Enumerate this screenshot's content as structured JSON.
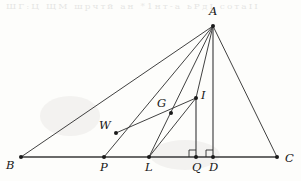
{
  "figure": {
    "width": 301,
    "height": 181,
    "background_color": "#fdfdfb",
    "line_color": "#2b2b2b",
    "base_line_color": "#3a3a3a",
    "vertical_line_color": "#555555",
    "label_color": "#161616"
  },
  "points": {
    "A": {
      "label": "A",
      "x": 213,
      "y": 26,
      "label_x": 209,
      "label_y": 6
    },
    "B": {
      "label": "B",
      "x": 21,
      "y": 157,
      "label_x": 6,
      "label_y": 160
    },
    "C": {
      "label": "C",
      "x": 277,
      "y": 157,
      "label_x": 285,
      "label_y": 153
    },
    "P": {
      "label": "P",
      "x": 104,
      "y": 157,
      "label_x": 100,
      "label_y": 162
    },
    "L": {
      "label": "L",
      "x": 149,
      "y": 157,
      "label_x": 145,
      "label_y": 162
    },
    "Q": {
      "label": "Q",
      "x": 196,
      "y": 157,
      "label_x": 192,
      "label_y": 162
    },
    "D": {
      "label": "D",
      "x": 213,
      "y": 157,
      "label_x": 209,
      "label_y": 162
    },
    "W": {
      "label": "W",
      "x": 116,
      "y": 133,
      "label_x": 99,
      "label_y": 120
    },
    "G": {
      "label": "G",
      "x": 171,
      "y": 113,
      "label_x": 157,
      "label_y": 98
    },
    "I": {
      "label": "I",
      "x": 196,
      "y": 98,
      "label_x": 201,
      "label_y": 90
    }
  },
  "segments": [
    {
      "name": "segment-BC",
      "from": "B",
      "to": "C",
      "style": "base"
    },
    {
      "name": "segment-AB",
      "from": "A",
      "to": "B",
      "style": "thin"
    },
    {
      "name": "segment-AC",
      "from": "A",
      "to": "C",
      "style": "thin"
    },
    {
      "name": "segment-AP",
      "from": "A",
      "to": "P",
      "style": "thin"
    },
    {
      "name": "segment-AL",
      "from": "A",
      "to": "L",
      "style": "thin"
    },
    {
      "name": "segment-AI",
      "from": "A",
      "to": "I",
      "style": "thin"
    },
    {
      "name": "segment-AD",
      "from": "A",
      "to": "D",
      "style": "vertical"
    },
    {
      "name": "segment-IQ",
      "from": "I",
      "to": "Q",
      "style": "vertical"
    },
    {
      "name": "segment-WI",
      "from": "W",
      "to": "I",
      "style": "thin"
    },
    {
      "name": "segment-LI",
      "from": "L",
      "to": "I",
      "style": "thin"
    }
  ],
  "right_angles": [
    {
      "name": "right-angle-Q",
      "at": "Q",
      "size": 7,
      "direction": "up-left"
    },
    {
      "name": "right-angle-D",
      "at": "D",
      "size": 7,
      "direction": "up-left"
    }
  ],
  "on_segment_points": [
    {
      "name": "point-W-on-AP",
      "point": "W",
      "lies_on": "segment-AP"
    },
    {
      "name": "point-G-on-AL",
      "point": "G",
      "lies_on": "segment-AL"
    }
  ],
  "artifacts": {
    "bleed_through_text": "ШГ:Ц    ЩМ шрчтй ан  *1нт-а ьРдІ    сотаІІ",
    "note": "faint reverse-side scan bleed across the top margin"
  }
}
